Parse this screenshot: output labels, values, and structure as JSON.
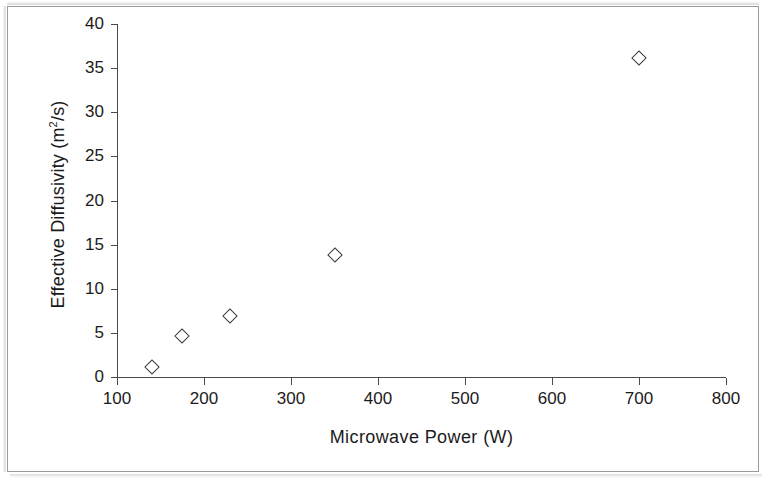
{
  "chart_data": {
    "type": "scatter",
    "title": "",
    "xlabel": "Microwave Power (W)",
    "ylabel": "Effective Diffusivity (m²/s)",
    "ylabel_base": "Effective Diffusivity (m",
    "ylabel_sup": "2",
    "ylabel_tail": "/s)",
    "xlim": [
      100,
      800
    ],
    "ylim": [
      0,
      40
    ],
    "xticks": [
      100,
      200,
      300,
      400,
      500,
      600,
      700,
      800
    ],
    "yticks": [
      0,
      5,
      10,
      15,
      20,
      25,
      30,
      35,
      40
    ],
    "xtick_labels": [
      "100",
      "200",
      "300",
      "400",
      "500",
      "600",
      "700",
      "800"
    ],
    "ytick_labels": [
      "0",
      "5",
      "10",
      "15",
      "20",
      "25",
      "30",
      "35",
      "40"
    ],
    "grid": false,
    "legend": null,
    "marker": "open-diamond",
    "marker_color": "#3a3a3a",
    "points": [
      {
        "x": 140,
        "y": 1.1
      },
      {
        "x": 175,
        "y": 4.6
      },
      {
        "x": 230,
        "y": 6.9
      },
      {
        "x": 350,
        "y": 13.8
      },
      {
        "x": 700,
        "y": 36.1
      }
    ]
  },
  "figure": {
    "border_color": "#9a9a9a",
    "background": "#ffffff",
    "axis_color": "#4a4a4a",
    "text_color": "#1b1b1b"
  }
}
